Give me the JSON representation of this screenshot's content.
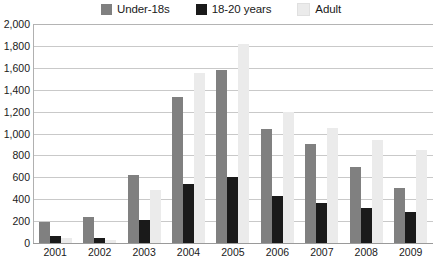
{
  "legend": {
    "position": "top-center",
    "items": [
      {
        "label": "Under-18s",
        "color": "#808080",
        "icon": "legend-swatch-icon"
      },
      {
        "label": "18-20 years",
        "color": "#1a1a1a",
        "icon": "legend-swatch-icon"
      },
      {
        "label": "Adult",
        "color": "#ebebeb",
        "icon": "legend-swatch-icon"
      }
    ]
  },
  "y_axis": {
    "ticks": [
      "0",
      "200",
      "400",
      "600",
      "800",
      "1,000",
      "1,200",
      "1,400",
      "1,600",
      "1,800",
      "2,000"
    ]
  },
  "x_axis": {
    "ticks": [
      "2001",
      "2002",
      "2003",
      "2004",
      "2005",
      "2006",
      "2007",
      "2008",
      "2009"
    ]
  },
  "caption": {
    "text": ""
  },
  "chart_data": {
    "type": "bar",
    "title": "",
    "subtitle": "",
    "xlabel": "",
    "ylabel": "",
    "ylim": [
      0,
      2000
    ],
    "ytick_step": 200,
    "grid": true,
    "legend_position": "top-center",
    "categories": [
      "2001",
      "2002",
      "2003",
      "2004",
      "2005",
      "2006",
      "2007",
      "2008",
      "2009"
    ],
    "series": [
      {
        "name": "Under-18s",
        "color": "#808080",
        "values": [
          190,
          240,
          620,
          1330,
          1580,
          1040,
          900,
          695,
          500
        ]
      },
      {
        "name": "18-20 years",
        "color": "#1a1a1a",
        "values": [
          65,
          45,
          210,
          540,
          600,
          430,
          365,
          320,
          280
        ]
      },
      {
        "name": "Adult",
        "color": "#ebebeb",
        "values": [
          45,
          30,
          480,
          1550,
          1820,
          1195,
          1050,
          940,
          850
        ]
      }
    ]
  }
}
